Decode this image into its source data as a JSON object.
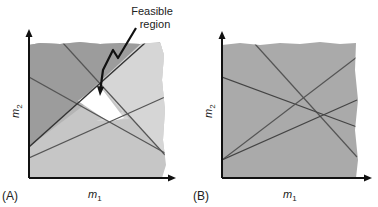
{
  "panels": [
    {
      "id": "A",
      "label": "(A)",
      "xlabel": "m",
      "xlabel_sub": "1",
      "ylabel": "m",
      "ylabel_sub": "2",
      "annotation": [
        "Feasible",
        "region"
      ],
      "colors": {
        "dark_region": "#9c9c9c",
        "mid_region": "#b4b4b4",
        "light_region": "#d6d6d6",
        "bottom_region": "#c6c6c6",
        "feasible": "#ffffff",
        "line": "#555555"
      }
    },
    {
      "id": "B",
      "label": "(B)",
      "xlabel": "m",
      "xlabel_sub": "1",
      "ylabel": "m",
      "ylabel_sub": "2",
      "colors": {
        "fill": "#aaaaaa",
        "line": "#555555"
      }
    }
  ]
}
